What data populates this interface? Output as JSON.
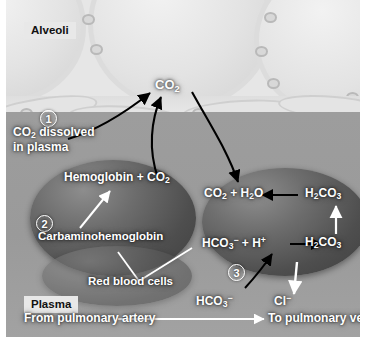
{
  "figure": {
    "type": "biological-process-diagram",
    "palette": {
      "alveolar_air": "#e6e6e6",
      "plasma": "#9a9a9a",
      "epithelium": "#dedede",
      "red_blood_cell": "#4e4e4e",
      "label_text": "#ffffff",
      "arrow_black": "#000000",
      "arrow_white": "#ffffff",
      "box_label_bg": "#e8e8e8"
    }
  },
  "regions": {
    "alveoli_label": "Alveoli",
    "plasma_label": "Plasma"
  },
  "steps": [
    {
      "number": "1",
      "label": "CO2 dissolved in plasma",
      "line1": "CO",
      "sub1": "2",
      "rest1": " dissolved",
      "line2": "in plasma"
    },
    {
      "number": "2",
      "label": "Carbaminohemoglobin"
    },
    {
      "number": "3",
      "label": "Bicarbonate / chloride shift"
    }
  ],
  "labels": {
    "co2_alveolar": {
      "text": "CO",
      "sub": "2"
    },
    "hemoglobin_co2": {
      "pre": "Hemoglobin + CO",
      "sub": "2"
    },
    "carbaminohemoglobin": "Carbaminohemoglobin",
    "red_blood_cells": "Red blood cells",
    "co2_plus_h2o": {
      "a": "CO",
      "a_sub": "2",
      "mid": " + H",
      "b_sub": "2",
      "b": "O"
    },
    "h2co3_top": {
      "pre": "H",
      "sub1": "2",
      "mid": "CO",
      "sub2": "3"
    },
    "h2co3_bottom": {
      "pre": "H",
      "sub1": "2",
      "mid": "CO",
      "sub2": "3"
    },
    "hco3_h_plus": {
      "pre": "HCO",
      "sub": "3",
      "sup": "−",
      "mid": " + H",
      "sup2": "+"
    },
    "hco3_plasma": {
      "pre": "HCO",
      "sub": "3",
      "sup": "−"
    },
    "cl_minus": {
      "pre": "Cl",
      "sup": "−"
    }
  },
  "flow": {
    "from_label": "From pulmonary artery",
    "to_label": "To pulmonary vein"
  }
}
